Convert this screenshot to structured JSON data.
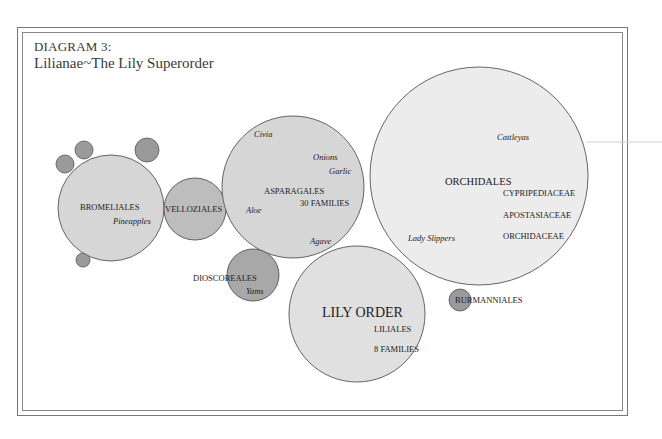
{
  "header": {
    "line1": "DIAGRAM 3:",
    "line2": "Lilianae~The Lily Superorder"
  },
  "colors": {
    "light_fill": "#d6d6d6",
    "lighter_fill": "#e8e8e8",
    "dark_fill": "#9a9a9a",
    "stroke": "#555555",
    "border": "#777777"
  },
  "nodes": {
    "bromeliales": {
      "label": "BROMELIALES",
      "example": "Pineapples"
    },
    "velloziales": {
      "label": "VELLOZIALES"
    },
    "asparagales": {
      "label": "ASPARAGALES",
      "families": "30 FAMILIES",
      "examples": [
        "Civia",
        "Onions",
        "Garlic",
        "Aloe",
        "Agave"
      ]
    },
    "dioscoreales": {
      "label": "DIOSCOREALES",
      "example": "Yams"
    },
    "liliales": {
      "title": "LILY ORDER",
      "label": "LILIALES",
      "families": "8 FAMILIES"
    },
    "orchidales": {
      "label": "ORCHIDALES",
      "example_top": "Cattleyas",
      "example_bottom": "Lady Slippers",
      "families": [
        "CYPRIPEDIACEAE",
        "APOSTASIACEAE",
        "ORCHIDACEAE"
      ]
    },
    "burmanniales": {
      "label": "BURMANNIALES"
    }
  }
}
